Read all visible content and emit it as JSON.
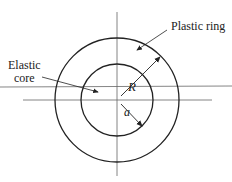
{
  "labels": {
    "plastic_ring": "Plastic ring",
    "elastic_line1": "Elastic",
    "elastic_line2": "core",
    "R": "R",
    "a": "a"
  },
  "geometry": {
    "center": [
      117,
      100
    ],
    "outer_radius": 62,
    "inner_radius": 36
  },
  "colors": {
    "stroke": "#222222",
    "axis": "#555555"
  }
}
